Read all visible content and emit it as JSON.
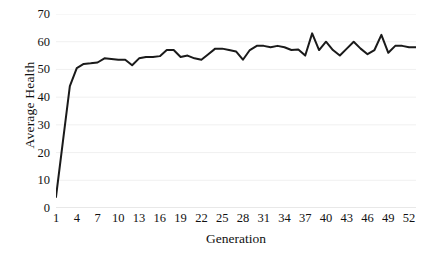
{
  "chart_data": {
    "type": "line",
    "title": "",
    "xlabel": "Generation",
    "ylabel": "Average Health",
    "xlim": [
      1,
      53
    ],
    "ylim": [
      0,
      70
    ],
    "ytick_step": 10,
    "yticks": [
      0,
      10,
      20,
      30,
      40,
      50,
      60,
      70
    ],
    "xticks": [
      1,
      4,
      7,
      10,
      13,
      16,
      19,
      22,
      25,
      28,
      31,
      34,
      37,
      40,
      43,
      46,
      49,
      52
    ],
    "grid": true,
    "grid_axis": "y",
    "legend": "none",
    "line_color": "#1a1a1a",
    "line_width": 2.0,
    "grid_color": "#f0f0f0",
    "background": "#ffffff",
    "x": [
      1,
      2,
      3,
      4,
      5,
      6,
      7,
      8,
      9,
      10,
      11,
      12,
      13,
      14,
      15,
      16,
      17,
      18,
      19,
      20,
      21,
      22,
      23,
      24,
      25,
      26,
      27,
      28,
      29,
      30,
      31,
      32,
      33,
      34,
      35,
      36,
      37,
      38,
      39,
      40,
      41,
      42,
      43,
      44,
      45,
      46,
      47,
      48,
      49,
      50,
      51,
      52,
      53
    ],
    "values": [
      4,
      24,
      44,
      50.5,
      52,
      52.2,
      52.5,
      54,
      53.8,
      53.5,
      53.5,
      51.5,
      54,
      54.5,
      54.5,
      54.8,
      57,
      57,
      54.5,
      55,
      54,
      53.5,
      55.5,
      57.5,
      57.5,
      57,
      56.5,
      53.5,
      57,
      58.5,
      58.5,
      58,
      58.5,
      58,
      57,
      57.2,
      55,
      63,
      57,
      60,
      57,
      55,
      57.5,
      60,
      57.5,
      55.5,
      57,
      62.5,
      56,
      58.5,
      58.5,
      58,
      58
    ]
  },
  "axes": {
    "y_title": "Average Health",
    "x_title": "Generation",
    "y_tick_labels": [
      "70",
      "60",
      "50",
      "40",
      "30",
      "20",
      "10",
      "0"
    ],
    "x_tick_labels": [
      "1",
      "4",
      "7",
      "10",
      "13",
      "16",
      "19",
      "22",
      "25",
      "28",
      "31",
      "34",
      "37",
      "40",
      "43",
      "46",
      "49",
      "52"
    ]
  }
}
